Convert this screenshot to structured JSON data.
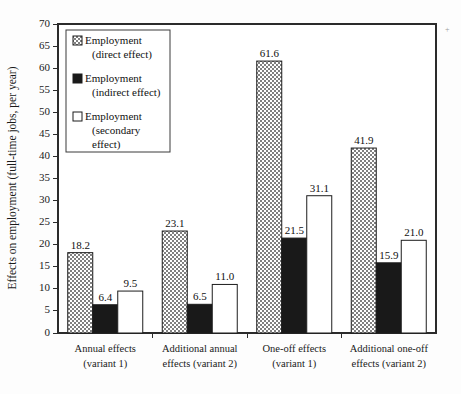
{
  "chart_data": {
    "type": "bar",
    "title": "",
    "xlabel": "",
    "ylabel": "Effects on employment (full-time jobs, per year)",
    "ylim": [
      0,
      70
    ],
    "ytick_step": 5,
    "yticks": [
      "0",
      "5",
      "10",
      "15",
      "20",
      "25",
      "30",
      "35",
      "40",
      "45",
      "50",
      "55",
      "60",
      "65",
      "70"
    ],
    "grid": false,
    "legend_position": "top-left",
    "categories": [
      "Annual effects\n(variant 1)",
      "Additional annual\neffects (variant 2)",
      "One-off effects\n(variant 1)",
      "Additional one-off\neffects (variant 2)"
    ],
    "category_lines": [
      [
        "Annual effects",
        "(variant 1)"
      ],
      [
        "Additional annual",
        "effects (variant 2)"
      ],
      [
        "One-off effects",
        "(variant 1)"
      ],
      [
        "Additional one-off",
        "effects (variant 2)"
      ]
    ],
    "series": [
      {
        "name": "Employment (direct effect)",
        "legend_lines": [
          "Employment",
          "(direct effect)"
        ],
        "fill": "hatch-gray",
        "color": "#8a8a8a",
        "values": [
          18.2,
          23.1,
          61.6,
          41.9
        ],
        "labels": [
          "18.2",
          "23.1",
          "61.6",
          "41.9"
        ]
      },
      {
        "name": "Employment (indirect effect)",
        "legend_lines": [
          "Employment",
          "(indirect effect)"
        ],
        "fill": "solid-black",
        "color": "#191919",
        "values": [
          6.4,
          6.5,
          21.5,
          15.9
        ],
        "labels": [
          "6.4",
          "6.5",
          "21.5",
          "15.9"
        ]
      },
      {
        "name": "Employment (secondary effect)",
        "legend_lines": [
          "Employment",
          "(secondary",
          "effect)"
        ],
        "fill": "solid-white",
        "color": "#ffffff",
        "values": [
          9.5,
          11.0,
          31.1,
          21.0
        ],
        "labels": [
          "9.5",
          "11.0",
          "31.1",
          "21.0"
        ]
      }
    ]
  },
  "legend": {
    "entries": [
      {
        "swatch": "hatch-gray",
        "lines": [
          "Employment",
          "(direct effect)"
        ]
      },
      {
        "swatch": "solid-black",
        "lines": [
          "Employment",
          "(indirect effect)"
        ]
      },
      {
        "swatch": "solid-white",
        "lines": [
          "Employment",
          "(secondary",
          "effect)"
        ]
      }
    ]
  }
}
